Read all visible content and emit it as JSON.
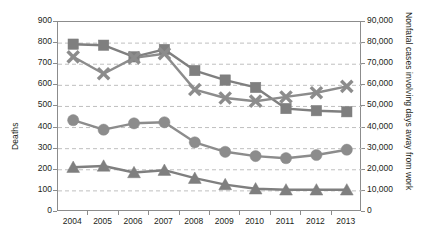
{
  "chart_data": {
    "type": "line",
    "title": "",
    "subtitle": "",
    "xlabel": "",
    "ylabel": "Deaths",
    "y2label": "Nonfatal cases involving days away from work",
    "categories": [
      "2004",
      "2005",
      "2006",
      "2007",
      "2008",
      "2009",
      "2010",
      "2011",
      "2012",
      "2013"
    ],
    "ylim": [
      0,
      900
    ],
    "y2lim": [
      0,
      90000
    ],
    "yticks": [
      "0",
      "100",
      "200",
      "300",
      "400",
      "500",
      "600",
      "700",
      "800",
      "900"
    ],
    "y2ticks": [
      "0",
      "10,000",
      "20,000",
      "30,000",
      "40,000",
      "50,000",
      "60,000",
      "70,000",
      "80,000",
      "90,000"
    ],
    "grid": true,
    "grid_style": "dashed-horizontal",
    "legend": "none",
    "legend_position": "none",
    "series": [
      {
        "name": "square-series",
        "marker": "square",
        "axis": "right",
        "color": "#7f7f7f",
        "values": [
          79500,
          79000,
          73500,
          77000,
          67000,
          62500,
          59000,
          49000,
          48000,
          47500
        ],
        "values_left_scale": [
          795,
          790,
          735,
          770,
          670,
          625,
          590,
          490,
          480,
          475
        ]
      },
      {
        "name": "x-series",
        "marker": "x",
        "axis": "right",
        "color": "#8c8c8c",
        "values": [
          73500,
          65500,
          73000,
          75000,
          58000,
          54000,
          52500,
          54500,
          56500,
          59500
        ],
        "values_left_scale": [
          735,
          655,
          730,
          750,
          580,
          540,
          525,
          545,
          565,
          595
        ]
      },
      {
        "name": "circle-series",
        "marker": "circle",
        "axis": "left",
        "color": "#8c8c8c",
        "values": [
          435,
          390,
          420,
          425,
          330,
          285,
          265,
          255,
          270,
          295
        ]
      },
      {
        "name": "triangle-series",
        "marker": "triangle",
        "axis": "left",
        "color": "#7f7f7f",
        "values": [
          212,
          218,
          187,
          198,
          160,
          130,
          110,
          105,
          105,
          105
        ]
      }
    ]
  },
  "axes": {
    "left_title": "Deaths",
    "right_title": "Nonfatal cases involving days away from work"
  }
}
